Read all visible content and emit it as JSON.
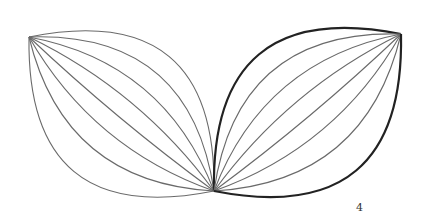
{
  "diagram": {
    "label": "4",
    "stroke_color": "#6a6a6a",
    "bold_stroke_color": "#222222",
    "leaves": [
      {
        "name": "left-leaf",
        "arc_count": 8,
        "bold_outline": false
      },
      {
        "name": "right-leaf",
        "arc_count": 8,
        "bold_outline": true
      }
    ]
  }
}
